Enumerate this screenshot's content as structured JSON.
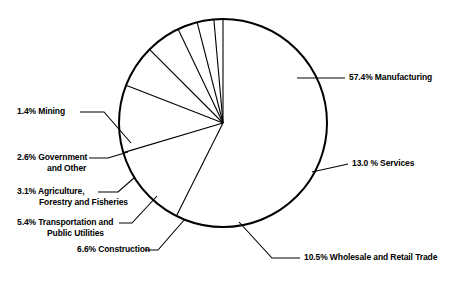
{
  "chart_data": {
    "type": "pie",
    "title": "",
    "subtitle": "",
    "xlabel": "",
    "ylabel": "",
    "legend_position": "callout-labels",
    "grid": false,
    "units": "percent",
    "total": 100.0,
    "start_angle_deg": 0,
    "direction": "clockwise",
    "categories": [
      "Manufacturing",
      "Services",
      "Wholesale and Retail Trade",
      "Construction",
      "Transportation and Public Utilities",
      "Agriculture, Forestry and Fisheries",
      "Government and Other",
      "Mining"
    ],
    "values": [
      57.4,
      13.0,
      10.5,
      6.6,
      5.4,
      3.1,
      2.6,
      1.4
    ],
    "slices": [
      {
        "label": "Manufacturing",
        "value": 57.4,
        "display": "57.4% Manufacturing"
      },
      {
        "label": "Services",
        "value": 13.0,
        "display": "13.0 % Services"
      },
      {
        "label": "Wholesale and Retail Trade",
        "value": 10.5,
        "display": "10.5% Wholesale and Retail Trade"
      },
      {
        "label": "Construction",
        "value": 6.6,
        "display": "6.6% Construction"
      },
      {
        "label": "Transportation and Public Utilities",
        "value": 5.4,
        "display": "5.4% Transportation and Public Utilities"
      },
      {
        "label": "Agriculture, Forestry and Fisheries",
        "value": 3.1,
        "display": "3.1% Agriculture, Forestry and Fisheries"
      },
      {
        "label": "Government and Other",
        "value": 2.6,
        "display": "2.6% Government and Other"
      },
      {
        "label": "Mining",
        "value": 1.4,
        "display": "1.4% Mining"
      }
    ],
    "colors": {
      "slice_fill": "#ffffff",
      "outline": "#000000",
      "leader_line": "#000000",
      "text": "#000000",
      "background": "#ffffff"
    }
  },
  "callouts": {
    "manufacturing": {
      "line1": "57.4% Manufacturing",
      "line2": ""
    },
    "services": {
      "line1": "13.0 % Services",
      "line2": ""
    },
    "wholesale": {
      "line1": "10.5% Wholesale and Retail Trade",
      "line2": ""
    },
    "construction": {
      "line1": "6.6% Construction",
      "line2": ""
    },
    "transportation": {
      "line1": "5.4% Transportation and",
      "line2": "Public Utilities"
    },
    "agriculture": {
      "line1": "3.1% Agriculture,",
      "line2": "Forestry and Fisheries"
    },
    "government": {
      "line1": "2.6% Government",
      "line2": "and Other"
    },
    "mining": {
      "line1": "1.4% Mining",
      "line2": ""
    }
  }
}
